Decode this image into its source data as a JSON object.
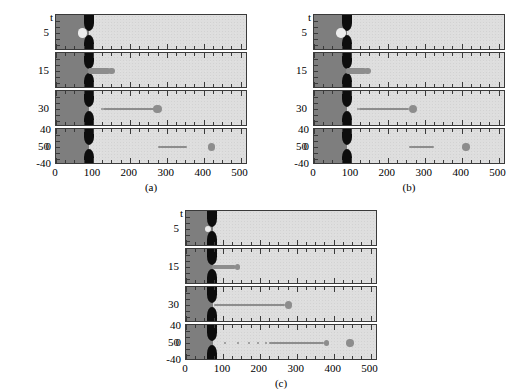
{
  "figure": {
    "type": "multi-panel simulation snapshot figure",
    "panels": [
      {
        "caption": "(a)"
      },
      {
        "caption": "(b)"
      },
      {
        "caption": "(c)"
      }
    ]
  },
  "axes": {
    "x_label_ticks": [
      "0",
      "100",
      "200",
      "300",
      "400",
      "500"
    ],
    "x_major_values": [
      0,
      100,
      200,
      300,
      400,
      500
    ],
    "x_minor_step": 25,
    "x_range": [
      0,
      520
    ],
    "time_axis_symbol": "t",
    "time_labels": [
      "5",
      "15",
      "30",
      "50"
    ],
    "y_axis_labels_bottom": [
      "40",
      "0",
      "-40"
    ],
    "y_range_bottom": [
      -40,
      40
    ]
  },
  "colors": {
    "background": "#ffffff",
    "domain_light": "#dedede",
    "reservoir_dark": "#7e7e7e",
    "nozzle_black": "#0d0d0d",
    "fluid_gray": "#8d8d8d",
    "bubble_light": "#ececec",
    "frame_border": "#3a3a3a"
  },
  "chart_data": {
    "type": "heatmap",
    "title": "",
    "xlabel": "",
    "ylabel": "t",
    "xlim": [
      0,
      520
    ],
    "ylim": [
      -40,
      40
    ],
    "xticks": [
      0,
      100,
      200,
      300,
      400,
      500
    ],
    "xticklabels": [
      "0",
      "100",
      "200",
      "300",
      "400",
      "500"
    ],
    "minor_tick_step": 25,
    "grid": false,
    "legend": "none",
    "panels": [
      {
        "label": "(a)",
        "nozzle_exit_x": 90,
        "orifice_half_width": 11,
        "frames": [
          {
            "t": 5,
            "features": [
              {
                "kind": "bubble",
                "cx": 72,
                "cy": 0,
                "rx": 13,
                "ry": 13
              }
            ]
          },
          {
            "t": 15,
            "features": [
              {
                "kind": "filament",
                "x0": 88,
                "x1": 145,
                "half_width": 7
              },
              {
                "kind": "drop",
                "cx": 150,
                "cy": 0,
                "r": 9
              }
            ]
          },
          {
            "t": 30,
            "features": [
              {
                "kind": "drop",
                "cx": 124,
                "cy": 0,
                "r": 2
              },
              {
                "kind": "filament",
                "x0": 128,
                "x1": 266,
                "half_width": 2
              },
              {
                "kind": "drop",
                "cx": 275,
                "cy": 0,
                "r": 11
              }
            ]
          },
          {
            "t": 50,
            "features": [
              {
                "kind": "drop",
                "cx": 281,
                "cy": 0,
                "r": 4
              },
              {
                "kind": "filament",
                "x0": 281,
                "x1": 352,
                "half_width": 1.5
              },
              {
                "kind": "drop",
                "cx": 352,
                "cy": 0,
                "r": 4
              },
              {
                "kind": "drop",
                "cx": 421,
                "cy": 0,
                "r": 10
              }
            ]
          }
        ]
      },
      {
        "label": "(b)",
        "nozzle_exit_x": 90,
        "orifice_half_width": 11,
        "frames": [
          {
            "t": 5,
            "features": [
              {
                "kind": "bubble",
                "cx": 73,
                "cy": 0,
                "rx": 13,
                "ry": 13
              }
            ]
          },
          {
            "t": 15,
            "features": [
              {
                "kind": "filament",
                "x0": 88,
                "x1": 140,
                "half_width": 7
              },
              {
                "kind": "drop",
                "cx": 145,
                "cy": 0,
                "r": 9
              }
            ]
          },
          {
            "t": 30,
            "features": [
              {
                "kind": "drop",
                "cx": 118,
                "cy": 0,
                "r": 2
              },
              {
                "kind": "filament",
                "x0": 122,
                "x1": 258,
                "half_width": 2
              },
              {
                "kind": "drop",
                "cx": 267,
                "cy": 0,
                "r": 11
              }
            ]
          },
          {
            "t": 50,
            "features": [
              {
                "kind": "drop",
                "cx": 262,
                "cy": 0,
                "r": 4
              },
              {
                "kind": "filament",
                "x0": 262,
                "x1": 322,
                "half_width": 1.5
              },
              {
                "kind": "drop",
                "cx": 322,
                "cy": 0,
                "r": 4
              },
              {
                "kind": "drop",
                "cx": 412,
                "cy": 0,
                "r": 10
              }
            ]
          }
        ]
      },
      {
        "label": "(c)",
        "nozzle_exit_x": 72,
        "orifice_half_width": 9,
        "frames": [
          {
            "t": 5,
            "features": [
              {
                "kind": "bubble",
                "cx": 60,
                "cy": 0,
                "rx": 9,
                "ry": 9
              }
            ]
          },
          {
            "t": 15,
            "features": [
              {
                "kind": "filament",
                "x0": 70,
                "x1": 135,
                "half_width": 6
              },
              {
                "kind": "drop",
                "cx": 140,
                "cy": 0,
                "r": 7
              }
            ]
          },
          {
            "t": 30,
            "features": [
              {
                "kind": "filament",
                "x0": 76,
                "x1": 268,
                "half_width": 2
              },
              {
                "kind": "drop",
                "cx": 277,
                "cy": 0,
                "r": 10
              }
            ]
          },
          {
            "t": 50,
            "features": [
              {
                "kind": "drop",
                "cx": 105,
                "cy": 0,
                "r": 2
              },
              {
                "kind": "drop",
                "cx": 141,
                "cy": 0,
                "r": 2
              },
              {
                "kind": "drop",
                "cx": 170,
                "cy": 0,
                "r": 2
              },
              {
                "kind": "drop",
                "cx": 196,
                "cy": 0,
                "r": 2
              },
              {
                "kind": "drop",
                "cx": 216,
                "cy": 0,
                "r": 3
              },
              {
                "kind": "drop",
                "cx": 228,
                "cy": 0,
                "r": 4
              },
              {
                "kind": "filament",
                "x0": 230,
                "x1": 374,
                "half_width": 1.5
              },
              {
                "kind": "drop",
                "cx": 380,
                "cy": 0,
                "r": 7
              },
              {
                "kind": "drop",
                "cx": 444,
                "cy": 0,
                "r": 10
              }
            ]
          }
        ]
      }
    ]
  }
}
